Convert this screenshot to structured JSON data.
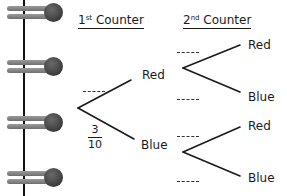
{
  "binder": {
    "ring_count": 4,
    "ring_positions_y": [
      3,
      57,
      113,
      168
    ]
  },
  "headers": {
    "first": {
      "ordinal": "1",
      "suffix": "st",
      "text": "Counter"
    },
    "second": {
      "ordinal": "2",
      "suffix": "nd",
      "text": "Counter"
    }
  },
  "tree": {
    "first_stage": {
      "outcomes": [
        {
          "label": "Red",
          "probability_blank": "----"
        },
        {
          "label": "Blue",
          "probability": {
            "numerator": "3",
            "denominator": "10"
          }
        }
      ]
    },
    "second_stage": {
      "after_red": [
        {
          "label": "Red",
          "probability_blank": "----"
        },
        {
          "label": "Blue",
          "probability_blank": "----"
        }
      ],
      "after_blue": [
        {
          "label": "Red",
          "probability_blank": "----"
        },
        {
          "label": "Blue",
          "probability_blank": "----"
        }
      ]
    }
  },
  "colors": {
    "ink": "#1a1a1a",
    "ring_bar": "#7f7f7f",
    "ring_knob": "#3c3c3c",
    "background": "#ffffff"
  }
}
